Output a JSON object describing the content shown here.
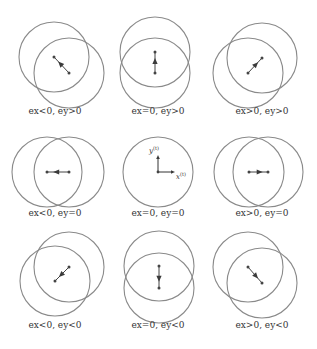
{
  "figure": {
    "title": "",
    "colors": {
      "circle_stroke": "#8a8a8a",
      "vector": "#444444",
      "text": "#333333"
    },
    "panels": [
      {
        "id": "p1",
        "label": "ex<0, ey>0",
        "label_pos": [
          55,
          112
        ],
        "circles": [
          [
            54,
            57
          ],
          [
            69,
            73
          ]
        ],
        "radius": 35,
        "arrow": {
          "from": [
            69,
            73
          ],
          "to": [
            54,
            57
          ]
        }
      },
      {
        "id": "p2",
        "label": "ex=0, ey>0",
        "label_pos": [
          158,
          112
        ],
        "circles": [
          [
            155,
            52
          ],
          [
            155,
            73
          ]
        ],
        "radius": 35,
        "arrow": {
          "from": [
            155,
            73
          ],
          "to": [
            155,
            52
          ]
        }
      },
      {
        "id": "p3",
        "label": "ex>0, ey>0",
        "label_pos": [
          262,
          112
        ],
        "circles": [
          [
            262,
            58
          ],
          [
            248,
            73
          ]
        ],
        "radius": 35,
        "arrow": {
          "from": [
            248,
            73
          ],
          "to": [
            262,
            58
          ]
        }
      },
      {
        "id": "p4",
        "label": "ex<0, ey=0",
        "label_pos": [
          55,
          214
        ],
        "circles": [
          [
            47,
            172
          ],
          [
            69,
            172
          ]
        ],
        "radius": 35,
        "arrow": {
          "from": [
            69,
            172
          ],
          "to": [
            47,
            172
          ]
        }
      },
      {
        "id": "p5",
        "label": "ex=0, ey=0",
        "label_pos": [
          158,
          214
        ],
        "circles": [
          [
            158,
            172
          ]
        ],
        "radius": 35,
        "axes": {
          "origin": [
            158,
            172
          ],
          "x_label": "x",
          "y_label": "y",
          "superscript": "(t)"
        }
      },
      {
        "id": "p6",
        "label": "ex>0, ey=0",
        "label_pos": [
          262,
          214
        ],
        "circles": [
          [
            249,
            172
          ],
          [
            268,
            172
          ]
        ],
        "radius": 35,
        "arrow": {
          "from": [
            249,
            172
          ],
          "to": [
            268,
            172
          ]
        }
      },
      {
        "id": "p7",
        "label": "ex<0, ey<0",
        "label_pos": [
          55,
          326
        ],
        "circles": [
          [
            69,
            267
          ],
          [
            55,
            281
          ]
        ],
        "radius": 35,
        "arrow": {
          "from": [
            69,
            267
          ],
          "to": [
            55,
            281
          ]
        }
      },
      {
        "id": "p8",
        "label": "ex=0, ey<0",
        "label_pos": [
          158,
          326
        ],
        "circles": [
          [
            159,
            266
          ],
          [
            159,
            288
          ]
        ],
        "radius": 35,
        "arrow": {
          "from": [
            159,
            266
          ],
          "to": [
            159,
            288
          ]
        }
      },
      {
        "id": "p9",
        "label": "ex>0, ey<0",
        "label_pos": [
          262,
          326
        ],
        "circles": [
          [
            248,
            267
          ],
          [
            262,
            283
          ]
        ],
        "radius": 35,
        "arrow": {
          "from": [
            248,
            267
          ],
          "to": [
            262,
            283
          ]
        }
      }
    ]
  }
}
